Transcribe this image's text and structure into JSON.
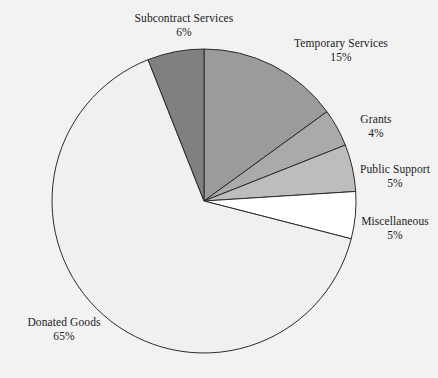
{
  "background_color": "#f2f2f2",
  "chart_data": {
    "type": "pie",
    "title": "",
    "subtitle": "",
    "xlabel": "",
    "ylabel": "",
    "legend_position": "none",
    "grid": false,
    "labels_show_percent": true,
    "start_angle_deg": 0,
    "direction": "clockwise",
    "categories": [
      "Temporary Services",
      "Grants",
      "Public Support",
      "Miscellaneous",
      "Donated Goods",
      "Subcontract Services"
    ],
    "values": [
      15,
      4,
      5,
      5,
      65,
      6
    ],
    "value_labels": [
      "15%",
      "4%",
      "5%",
      "5%",
      "65%",
      "6%"
    ],
    "colors": [
      "#9b9b9b",
      "#aaaaaa",
      "#bdbdbd",
      "#ffffff",
      "#f0f0f0",
      "#808080"
    ],
    "slice_outline_color": "#2b2b2b",
    "slices": [
      {
        "name": "Temporary Services",
        "value": 15,
        "value_label": "15%",
        "color": "#9b9b9b"
      },
      {
        "name": "Grants",
        "value": 4,
        "value_label": "4%",
        "color": "#aaaaaa"
      },
      {
        "name": "Public Support",
        "value": 5,
        "value_label": "5%",
        "color": "#bdbdbd"
      },
      {
        "name": "Miscellaneous",
        "value": 5,
        "value_label": "5%",
        "color": "#ffffff"
      },
      {
        "name": "Donated Goods",
        "value": 65,
        "value_label": "65%",
        "color": "#f0f0f0"
      },
      {
        "name": "Subcontract Services",
        "value": 6,
        "value_label": "6%",
        "color": "#808080"
      }
    ]
  },
  "geometry": {
    "center_x": 204,
    "center_y": 201,
    "radius": 152
  }
}
